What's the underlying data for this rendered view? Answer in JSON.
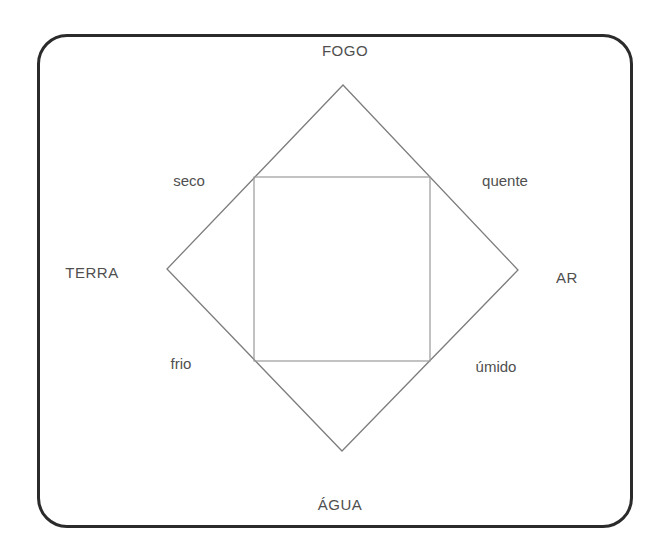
{
  "diagram": {
    "elements": {
      "top": "FOGO",
      "right": "AR",
      "bottom": "ÁGUA",
      "left": "TERRA"
    },
    "qualities": {
      "top_left": "seco",
      "top_right": "quente",
      "bottom_left": "frio",
      "bottom_right": "úmido"
    },
    "colors": {
      "frame_border": "#2b2b2b",
      "diamond_line": "#7d7d7d",
      "square_line": "#9a9a9a",
      "text": "#4f4f4f",
      "background": "#ffffff"
    }
  }
}
